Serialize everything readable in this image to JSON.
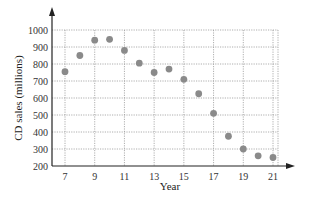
{
  "chart_data": {
    "type": "scatter",
    "title": "",
    "xlabel": "Year",
    "ylabel": "CD sales (millions)",
    "xlim": [
      6,
      22
    ],
    "ylim": [
      200,
      1000
    ],
    "x_ticks": [
      7,
      9,
      11,
      13,
      15,
      17,
      19,
      21
    ],
    "y_ticks": [
      200,
      300,
      400,
      500,
      600,
      700,
      800,
      900,
      1000
    ],
    "grid": true,
    "legend": null,
    "series": [
      {
        "name": "CD sales",
        "color": "#8a8a8a",
        "x": [
          7,
          8,
          9,
          10,
          11,
          12,
          13,
          14,
          15,
          16,
          17,
          18,
          19,
          20,
          21
        ],
        "y": [
          755,
          850,
          940,
          945,
          880,
          805,
          750,
          770,
          710,
          625,
          510,
          375,
          300,
          260,
          250
        ]
      }
    ]
  }
}
